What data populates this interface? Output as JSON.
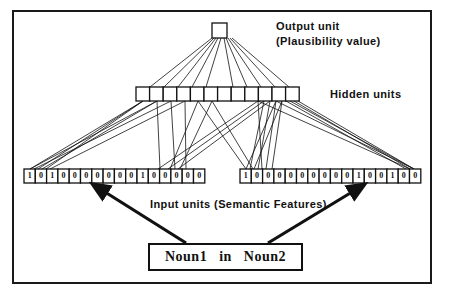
{
  "figure": {
    "background_color": "#ffffff",
    "ink_color": "#111111",
    "frame": {
      "x": 12,
      "y": 10,
      "width": 420,
      "height": 274,
      "border_px": 2
    }
  },
  "labels": {
    "output_line1": "Output unit",
    "output_line2": "(Plausibility  value)",
    "hidden": "Hidden units",
    "input": "Input units (Semantic Features)",
    "sentence": "Noun1   in   Noun2"
  },
  "layers": {
    "output": {
      "name": "output-unit",
      "count": 1,
      "x": 212,
      "y": 23,
      "size": 15,
      "values": [
        ""
      ]
    },
    "hidden": {
      "name": "hidden-units",
      "count": 12,
      "x": 136,
      "y": 87,
      "cell_width": 13.6,
      "cell_height": 14,
      "values": [
        "",
        "",
        "",
        "",
        "",
        "",
        "",
        "",
        "",
        "",
        "",
        ""
      ]
    },
    "input_left": {
      "name": "input-units-noun1",
      "count": 16,
      "x": 24,
      "y": 169,
      "cell_width": 11.3,
      "cell_height": 14,
      "values": [
        "1",
        "0",
        "1",
        "0",
        "0",
        "0",
        "0",
        "0",
        "0",
        "0",
        "1",
        "0",
        "0",
        "0",
        "0",
        "0"
      ]
    },
    "input_right": {
      "name": "input-units-noun2",
      "count": 16,
      "x": 240,
      "y": 169,
      "cell_width": 11.3,
      "cell_height": 14,
      "values": [
        "1",
        "0",
        "0",
        "0",
        "0",
        "0",
        "0",
        "0",
        "0",
        "0",
        "1",
        "0",
        "0",
        "1",
        "0",
        "0"
      ]
    }
  },
  "connections": {
    "output_to_hidden": [
      [
        212.0,
        38,
        150.0,
        87
      ],
      [
        214.0,
        38,
        164.0,
        87
      ],
      [
        216.0,
        38,
        178.0,
        87
      ],
      [
        218.0,
        38,
        192.0,
        87
      ],
      [
        221.0,
        38,
        206.0,
        87
      ],
      [
        224.0,
        38,
        233.0,
        87
      ],
      [
        226.0,
        38,
        247.0,
        87
      ],
      [
        228.0,
        38,
        261.0,
        87
      ],
      [
        230.0,
        38,
        275.0,
        87
      ],
      [
        232.0,
        38,
        289.0,
        87
      ]
    ],
    "hidden_to_input": [
      [
        143,
        101,
        30,
        169
      ],
      [
        143,
        101,
        38,
        169
      ],
      [
        143,
        101,
        46,
        169
      ],
      [
        157,
        101,
        30,
        169
      ],
      [
        157,
        101,
        42,
        169
      ],
      [
        157,
        101,
        160,
        169
      ],
      [
        171,
        101,
        34,
        169
      ],
      [
        171,
        101,
        175,
        169
      ],
      [
        185,
        101,
        50,
        169
      ],
      [
        185,
        101,
        186,
        169
      ],
      [
        198,
        101,
        170,
        169
      ],
      [
        198,
        101,
        246,
        169
      ],
      [
        212,
        101,
        180,
        169
      ],
      [
        212,
        101,
        253,
        169
      ],
      [
        258,
        101,
        158,
        169
      ],
      [
        258,
        101,
        262,
        169
      ],
      [
        264,
        101,
        168,
        169
      ],
      [
        264,
        101,
        250,
        169
      ],
      [
        270,
        101,
        178,
        169
      ],
      [
        270,
        101,
        258,
        169
      ],
      [
        276,
        101,
        246,
        169
      ],
      [
        276,
        101,
        266,
        169
      ],
      [
        282,
        101,
        254,
        169
      ],
      [
        282,
        101,
        272,
        169
      ],
      [
        276,
        101,
        414,
        169
      ],
      [
        286,
        101,
        406,
        169
      ],
      [
        290,
        101,
        414,
        169
      ],
      [
        294,
        101,
        410,
        169
      ],
      [
        298,
        101,
        414,
        169
      ],
      [
        258,
        101,
        410,
        169
      ]
    ]
  },
  "arrows": [
    {
      "name": "arrow-to-left-input",
      "x1": 186,
      "y1": 243,
      "x2": 105,
      "y2": 192
    },
    {
      "name": "arrow-to-right-input",
      "x1": 268,
      "y1": 243,
      "x2": 352,
      "y2": 192
    }
  ]
}
